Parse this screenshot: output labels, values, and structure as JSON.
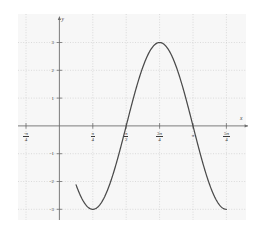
{
  "figure": {
    "background": "#ffffff",
    "plot_background": "#f7f7f7",
    "grid_color": "#cfcfcf",
    "axis_color": "#6e6e6e",
    "curve_color": "#4a4a4a"
  },
  "chart_data": {
    "type": "line",
    "title": "",
    "xlabel": "x",
    "ylabel": "y",
    "grid": true,
    "legend": "none",
    "xlim": [
      -1.1780972451,
      4.3196898987
    ],
    "ylim": [
      -3.7,
      3.7
    ],
    "function": "y = 3*cos(2*(x - 3*pi/4))",
    "amplitude": 3,
    "period": 3.14159265,
    "x_tick_values": [
      -0.7853981634,
      0,
      0.7853981634,
      1.5707963268,
      2.3561944902,
      3.1415926536,
      3.926990817
    ],
    "x_tick_labels": [
      "-π/4",
      "",
      "π/4",
      "π/2",
      "3π/4",
      "π",
      "5π/4"
    ],
    "x_tick_numerators": [
      "-π",
      "",
      "π",
      "π",
      "3π",
      "π",
      "5π"
    ],
    "x_tick_denominators": [
      "4",
      "",
      "4",
      "2",
      "4",
      "",
      "4"
    ],
    "y_tick_values": [
      3,
      2,
      1,
      -1,
      -2,
      -3
    ],
    "y_tick_labels": [
      "3",
      "2",
      "1",
      "-1",
      "-2",
      "-3"
    ],
    "x": [
      0.3926990817,
      0.4908738521,
      0.5890486225,
      0.6872233929,
      0.7853981634,
      0.8835729338,
      0.9817477042,
      1.0799224746,
      1.178097245,
      1.2762720155,
      1.3744467859,
      1.4726215563,
      1.5707963268,
      1.6689710972,
      1.7671458676,
      1.865320638,
      1.9634954085,
      2.0616701789,
      2.1598449493,
      2.2580197197,
      2.3561944902,
      2.4543692606,
      2.552544031,
      2.6507188014,
      2.7488935719,
      2.8470683423,
      2.9452431127,
      3.0434178831,
      3.1415926536,
      3.239767424,
      3.3379421944,
      3.4361169648,
      3.5342917353,
      3.6324665057,
      3.7306412761,
      3.8288160465,
      3.926990817
    ],
    "y": [
      -3.0,
      -2.9087,
      -2.6383,
      -2.2021,
      -1.6232,
      -0.9326,
      -0.1678,
      0.6283,
      1.4142,
      2.1478,
      2.7716,
      3.0,
      3.0,
      2.7716,
      2.1478,
      1.4142,
      0.6283,
      -0.1678,
      -0.9326,
      -1.6232,
      -2.2021,
      -2.6383,
      -2.9087,
      -3.0,
      -2.9087,
      -2.6383,
      -2.2021,
      -1.6232,
      -0.9326,
      -0.1678,
      0.6283,
      1.4142,
      2.1478,
      2.7716,
      3.0,
      2.7716,
      -3.0
    ],
    "curve_start_x": 0.3926990817,
    "curve_end_x": 3.926990817,
    "peak": {
      "x": 2.3561944902,
      "y": 3
    },
    "minima": [
      {
        "x": 0.7853981634,
        "y": -3
      },
      {
        "x": 3.926990817,
        "y": -3
      }
    ]
  },
  "axes": {
    "x_axis_label": "x",
    "y_axis_label": "y"
  }
}
